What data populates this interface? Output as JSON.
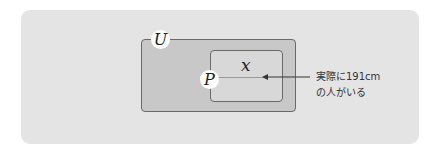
{
  "diagram": {
    "universe_label": "U",
    "subset_label": "P",
    "element_label": "x",
    "annotation": {
      "line1": "実際に191cm",
      "line2": "の人がいる"
    },
    "colors": {
      "panel_bg": "#e4e4e4",
      "universe_fill": "#c8c8c8",
      "subset_fill": "#d8d8d8",
      "border": "#6a6a6a",
      "label_circle": "#ffffff"
    }
  }
}
